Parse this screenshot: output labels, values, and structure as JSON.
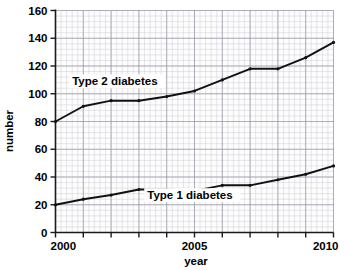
{
  "chart_data": {
    "type": "line",
    "title": "",
    "xlabel": "year",
    "ylabel": "number",
    "xlim": [
      2000,
      2010
    ],
    "ylim": [
      0,
      160
    ],
    "ytick_step": 20,
    "xtick_step": 1,
    "grid": true,
    "grid_minor": true,
    "legend_position": "inline-annotations",
    "x": [
      2000,
      2001,
      2002,
      2003,
      2004,
      2005,
      2006,
      2007,
      2008,
      2009,
      2010
    ],
    "yticks": [
      0,
      20,
      40,
      60,
      80,
      100,
      120,
      140,
      160
    ],
    "ytick_labels": [
      "0",
      "20",
      "40",
      "60",
      "80",
      "100",
      "120",
      "140",
      "160"
    ],
    "xticks": [
      2000,
      2001,
      2002,
      2003,
      2004,
      2005,
      2006,
      2007,
      2008,
      2009,
      2010
    ],
    "xtick_labels": [
      "2000",
      "",
      "",
      "",
      "",
      "2005",
      "",
      "",
      "",
      "",
      "2010"
    ],
    "series": [
      {
        "name": "Type 2 diabetes",
        "color": "#111111",
        "values": [
          80,
          91,
          95,
          95,
          98,
          102,
          110,
          118,
          118,
          126,
          137
        ],
        "annotation": "Type 2 diabetes"
      },
      {
        "name": "Type 1 diabetes",
        "color": "#111111",
        "values": [
          20,
          24,
          27,
          31,
          31,
          30,
          34,
          34,
          38,
          42,
          48
        ],
        "annotation": "Type 1 diabetes"
      }
    ],
    "annotations": [
      {
        "text": "Type 2 diabetes",
        "x": 2000.6,
        "y": 106
      },
      {
        "text": "Type 1 diabetes",
        "x": 2003.3,
        "y": 24
      }
    ]
  },
  "axes": {
    "y_axis_title": "number",
    "x_axis_title": "year"
  }
}
